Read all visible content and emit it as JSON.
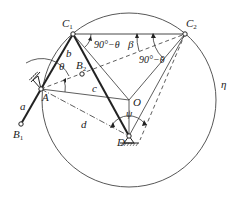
{
  "diagram": {
    "points": {
      "A": {
        "label": "A",
        "x": 41,
        "y": 89
      },
      "B1": {
        "label": "B",
        "sub": "1",
        "x": 21,
        "y": 124
      },
      "B2": {
        "label": "B",
        "sub": "2",
        "x": 82,
        "y": 74
      },
      "C1": {
        "label": "C",
        "sub": "1",
        "x": 73,
        "y": 34
      },
      "C2": {
        "label": "C",
        "sub": "2",
        "x": 185,
        "y": 34
      },
      "O": {
        "label": "O",
        "x": 129,
        "y": 100
      },
      "D": {
        "label": "D",
        "x": 129,
        "y": 136
      }
    },
    "circle": {
      "label": "η",
      "cx": 129,
      "cy": 100,
      "r": 87
    },
    "links": {
      "a": "a",
      "b": "b",
      "c": "c",
      "d": "d"
    },
    "angles": {
      "theta": "θ",
      "beta": "β",
      "psi": "ψ",
      "angle_c1": "90°−θ",
      "angle_c2": "90°−θ"
    }
  }
}
